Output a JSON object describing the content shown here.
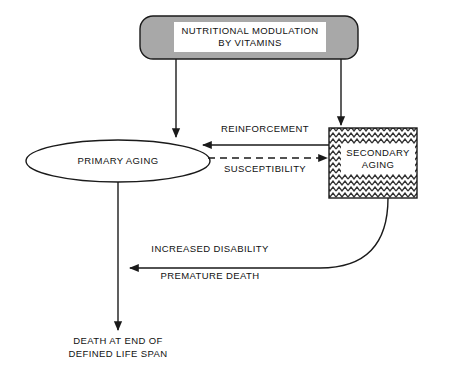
{
  "diagram": {
    "colors": {
      "stroke": "#1a1a1a",
      "top_box_fill": "#a8a8a8",
      "label_plate": "#ffffff",
      "background": "#ffffff",
      "hatch": "#3a3a3a"
    },
    "nodes": {
      "top_box": {
        "label_line1": "NUTRITIONAL MODULATION",
        "label_line2": "BY VITAMINS",
        "shape": "rounded-rectangle",
        "fill": "gray"
      },
      "primary_aging": {
        "label": "PRIMARY AGING",
        "shape": "ellipse",
        "fill": "white"
      },
      "secondary_aging": {
        "label_line1": "SECONDARY",
        "label_line2": "AGING",
        "shape": "rectangle",
        "fill": "zigzag-hatch"
      },
      "death_outcome": {
        "label_line1": "DEATH AT END OF",
        "label_line2": "DEFINED LIFE SPAN",
        "shape": "text"
      }
    },
    "edges": [
      {
        "name": "top-to-primary",
        "from": "top_box",
        "to": "primary_aging",
        "label": "",
        "style": "solid",
        "arrow": "down"
      },
      {
        "name": "top-to-secondary",
        "from": "top_box",
        "to": "secondary_aging",
        "label": "",
        "style": "solid",
        "arrow": "down"
      },
      {
        "name": "reinforcement",
        "from": "secondary_aging",
        "to": "primary_aging",
        "label": "REINFORCEMENT",
        "style": "solid",
        "arrow": "left"
      },
      {
        "name": "susceptibility",
        "from": "primary_aging",
        "to": "secondary_aging",
        "label": "SUSCEPTIBILITY",
        "style": "dashed",
        "arrow": "right"
      },
      {
        "name": "disability-death",
        "from": "secondary_aging",
        "to": "primary_aging_axis",
        "label_above": "INCREASED DISABILITY",
        "label_below": "PREMATURE DEATH",
        "style": "solid-curved",
        "arrow": "left"
      },
      {
        "name": "primary-to-death",
        "from": "primary_aging",
        "to": "death_outcome",
        "label": "",
        "style": "solid",
        "arrow": "down"
      }
    ]
  }
}
